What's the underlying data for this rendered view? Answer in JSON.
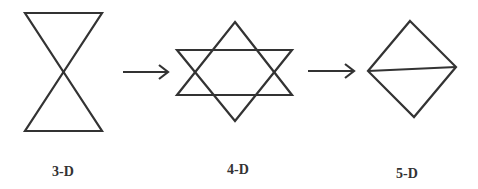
{
  "diagram": {
    "stroke_color": "#333333",
    "stages": [
      {
        "label": "3-D",
        "shape": "hourglass"
      },
      {
        "label": "4-D",
        "shape": "hexagram"
      },
      {
        "label": "5-D",
        "shape": "diamond-with-chord"
      }
    ],
    "arrows": [
      {
        "from": "3-D",
        "to": "4-D",
        "icon": "right-arrow-icon"
      },
      {
        "from": "4-D",
        "to": "5-D",
        "icon": "right-arrow-icon"
      }
    ]
  }
}
